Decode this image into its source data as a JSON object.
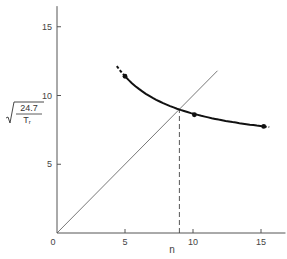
{
  "chart_data": {
    "type": "line",
    "title": "",
    "xlabel": "n",
    "ylabel": "sqrt(24.7 / T_r)",
    "ylabel_parts": {
      "numerator": "24.7",
      "denominator": "T",
      "denominator_sub": "r"
    },
    "xlim": [
      0,
      16.8
    ],
    "ylim": [
      0,
      16.5
    ],
    "x_ticks": [
      0,
      5,
      10,
      15
    ],
    "y_ticks": [
      5,
      10,
      15
    ],
    "x_tick_labels": [
      "0",
      "5",
      "10",
      "15"
    ],
    "y_tick_labels": [
      "5",
      "10",
      "15"
    ],
    "grid": false,
    "legend": null,
    "series": [
      {
        "name": "measured curve",
        "style": "solid-thick-with-dashed-ends",
        "points": [
          {
            "x": 5.0,
            "y": 11.4
          },
          {
            "x": 10.1,
            "y": 8.6
          },
          {
            "x": 15.2,
            "y": 7.75
          }
        ],
        "curve_extent": {
          "x_start": 4.4,
          "x_end": 15.6
        }
      },
      {
        "name": "y = n",
        "style": "thin-line",
        "points": [
          {
            "x": 0,
            "y": 0
          },
          {
            "x": 11.8,
            "y": 11.8
          }
        ]
      }
    ],
    "annotations": [
      {
        "type": "dashed-vertical",
        "x": 9.0,
        "y_from": 0,
        "y_to": 9.0,
        "label": "intersection n ≈ 9"
      }
    ],
    "intersection": {
      "x": 9.0,
      "y": 9.0
    }
  }
}
